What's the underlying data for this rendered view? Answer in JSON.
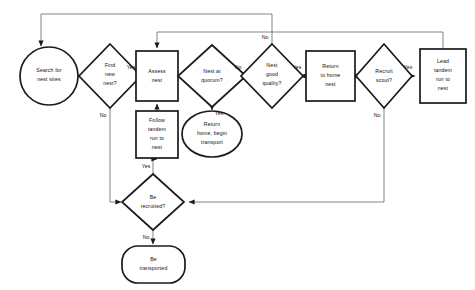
{
  "diagram": {
    "canvas": {
      "width": 475,
      "height": 290
    },
    "style": {
      "shape_stroke": "#1a1a1a",
      "connector_stroke": "#6d6d6d",
      "background": "#ffffff",
      "text": "#111111"
    },
    "nodes": [
      {
        "id": "search",
        "shape": "circle",
        "label_lines": [
          "Search for",
          "nest sites"
        ],
        "cx": 49,
        "cy": 76,
        "rx": 29,
        "ry": 29
      },
      {
        "id": "find_new",
        "shape": "diamond",
        "label_lines": [
          "Find",
          "new",
          "nest?"
        ],
        "cx": 110,
        "cy": 76,
        "rx": 31,
        "ry": 32
      },
      {
        "id": "assess",
        "shape": "rect",
        "label_lines": [
          "Assess",
          "nest"
        ],
        "cx": 157,
        "cy": 76,
        "rx": 21,
        "ry": 25
      },
      {
        "id": "quorum",
        "shape": "diamond",
        "label_lines": [
          "Nest at",
          "quorum?"
        ],
        "cx": 212,
        "cy": 76,
        "rx": 34,
        "ry": 31
      },
      {
        "id": "good_quality",
        "shape": "diamond",
        "label_lines": [
          "Nest",
          "good",
          "quality?"
        ],
        "cx": 272,
        "cy": 76,
        "rx": 31,
        "ry": 32
      },
      {
        "id": "return_home",
        "shape": "rect",
        "label_lines": [
          "Return",
          "to home",
          "nest"
        ],
        "cx": 330,
        "cy": 76,
        "rx": 25,
        "ry": 25
      },
      {
        "id": "recruit",
        "shape": "diamond",
        "label_lines": [
          "Recruit",
          "scout?"
        ],
        "cx": 384,
        "cy": 76,
        "rx": 28,
        "ry": 32
      },
      {
        "id": "lead_tandem",
        "shape": "rect",
        "label_lines": [
          "Lead",
          "tandem",
          "run to",
          "nest"
        ],
        "cx": 443,
        "cy": 76,
        "rx": 23,
        "ry": 27
      },
      {
        "id": "follow_tandem",
        "shape": "rect",
        "label_lines": [
          "Follow",
          "tandem",
          "run to",
          "nest"
        ],
        "cx": 157,
        "cy": 134,
        "rx": 21,
        "ry": 23
      },
      {
        "id": "return_begin",
        "shape": "ellipse",
        "label_lines": [
          "Return",
          "home, begin",
          "transport"
        ],
        "cx": 212,
        "cy": 134,
        "rx": 30,
        "ry": 23
      },
      {
        "id": "be_recruited",
        "shape": "diamond",
        "label_lines": [
          "Be",
          "recruited?"
        ],
        "cx": 153,
        "cy": 202,
        "rx": 31,
        "ry": 28
      },
      {
        "id": "be_transported",
        "shape": "rounded-rect",
        "label_lines": [
          "Be",
          "transported"
        ],
        "cx": 153,
        "cy": 265,
        "rx": 32,
        "ry": 18
      }
    ],
    "edges": [
      {
        "id": "search-to-find",
        "from": "search",
        "to": "find_new",
        "label": ""
      },
      {
        "id": "find-yes-to-assess",
        "from": "find_new",
        "to": "assess",
        "label": "Yes"
      },
      {
        "id": "find-no-to-be-recruited",
        "from": "find_new",
        "to": "be_recruited",
        "label": "No"
      },
      {
        "id": "assess-to-quorum",
        "from": "assess",
        "to": "quorum",
        "label": ""
      },
      {
        "id": "quorum-no-to-quality",
        "from": "quorum",
        "to": "good_quality",
        "label": "No"
      },
      {
        "id": "quorum-yes-to-return-begin",
        "from": "quorum",
        "to": "return_begin",
        "label": "Yes"
      },
      {
        "id": "quality-no-to-search",
        "from": "good_quality",
        "to": "search",
        "label": "No"
      },
      {
        "id": "quality-yes-to-return-home",
        "from": "good_quality",
        "to": "return_home",
        "label": "Yes"
      },
      {
        "id": "return-home-to-recruit",
        "from": "return_home",
        "to": "recruit",
        "label": ""
      },
      {
        "id": "recruit-yes-to-lead",
        "from": "recruit",
        "to": "lead_tandem",
        "label": "Yes"
      },
      {
        "id": "recruit-no-to-be-recruited",
        "from": "recruit",
        "to": "be_recruited",
        "label": "No"
      },
      {
        "id": "lead-to-assess",
        "from": "lead_tandem",
        "to": "assess",
        "label": ""
      },
      {
        "id": "recruited-yes-to-follow",
        "from": "be_recruited",
        "to": "follow_tandem",
        "label": "Yes"
      },
      {
        "id": "recruited-no-to-transported",
        "from": "be_recruited",
        "to": "be_transported",
        "label": "No"
      },
      {
        "id": "follow-to-assess",
        "from": "follow_tandem",
        "to": "assess",
        "label": ""
      }
    ],
    "edge_labels": {
      "find_yes": "Yes",
      "find_no": "No",
      "quorum_no": "No",
      "quorum_yes": "Yes",
      "quality_no": "No",
      "quality_yes": "Yes",
      "recruit_yes": "Yes",
      "recruit_no": "No",
      "recruited_yes": "Yes",
      "recruited_no": "No"
    }
  }
}
